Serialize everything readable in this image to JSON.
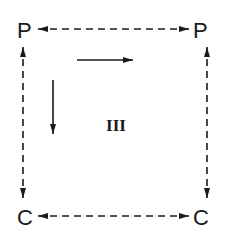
{
  "diagram": {
    "nodes": {
      "top_left": "P",
      "top_right": "P",
      "bottom_left": "C",
      "bottom_right": "C"
    },
    "center_label": "III",
    "edges": [
      {
        "from": "top_left",
        "to": "top_right",
        "style": "dashed",
        "direction": "bidirectional"
      },
      {
        "from": "bottom_left",
        "to": "bottom_right",
        "style": "dashed",
        "direction": "bidirectional"
      },
      {
        "from": "top_left",
        "to": "bottom_left",
        "style": "dashed",
        "direction": "bidirectional"
      },
      {
        "from": "top_right",
        "to": "bottom_right",
        "style": "dashed",
        "direction": "bidirectional"
      }
    ],
    "inner_arrows": [
      {
        "name": "horizontal",
        "direction": "right",
        "style": "solid"
      },
      {
        "name": "vertical",
        "direction": "down",
        "style": "solid"
      }
    ],
    "colors": {
      "ink": "#1a1a1a",
      "background": "#ffffff"
    }
  }
}
